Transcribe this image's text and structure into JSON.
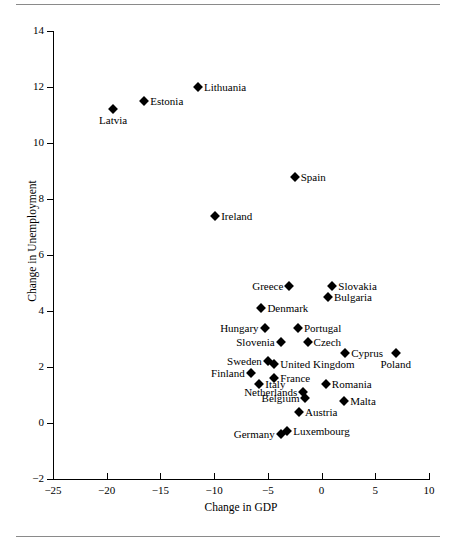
{
  "figure": {
    "rule_top": "horizontal-rule",
    "rule_bottom": "horizontal-rule"
  },
  "chart_data": {
    "type": "scatter",
    "title": "",
    "xlabel": "Change in GDP",
    "ylabel": "Change in Unemployment",
    "xlim": [
      -25,
      10
    ],
    "ylim": [
      -2,
      14
    ],
    "xticks": [
      -25,
      -20,
      -15,
      -10,
      -5,
      0,
      5,
      10
    ],
    "xtick_labels": [
      "−25",
      "−20",
      "−15",
      "−10",
      "−5",
      "0",
      "5",
      "10"
    ],
    "yticks": [
      -2,
      0,
      2,
      4,
      6,
      8,
      10,
      12,
      14
    ],
    "ytick_labels": [
      "−2",
      "0",
      "2",
      "4",
      "6",
      "8",
      "10",
      "12",
      "14"
    ],
    "grid": false,
    "legend": "none",
    "marker": "diamond",
    "marker_color": "#000000",
    "points": [
      {
        "label": "Latvia",
        "x": -19.4,
        "y": 11.2,
        "label_pos": "below"
      },
      {
        "label": "Estonia",
        "x": -16.5,
        "y": 11.5,
        "label_pos": "right"
      },
      {
        "label": "Lithuania",
        "x": -11.5,
        "y": 12.0,
        "label_pos": "right"
      },
      {
        "label": "Spain",
        "x": -2.5,
        "y": 8.8,
        "label_pos": "right"
      },
      {
        "label": "Ireland",
        "x": -9.9,
        "y": 7.4,
        "label_pos": "right"
      },
      {
        "label": "Greece",
        "x": -3.0,
        "y": 4.9,
        "label_pos": "left"
      },
      {
        "label": "Slovakia",
        "x": 1.0,
        "y": 4.9,
        "label_pos": "right"
      },
      {
        "label": "Bulgaria",
        "x": 0.6,
        "y": 4.5,
        "label_pos": "right"
      },
      {
        "label": "Denmark",
        "x": -5.6,
        "y": 4.1,
        "label_pos": "right"
      },
      {
        "label": "Hungary",
        "x": -5.3,
        "y": 3.4,
        "label_pos": "left"
      },
      {
        "label": "Portugal",
        "x": -2.2,
        "y": 3.4,
        "label_pos": "right"
      },
      {
        "label": "Slovenia",
        "x": -3.8,
        "y": 2.9,
        "label_pos": "left"
      },
      {
        "label": "Czech",
        "x": -1.3,
        "y": 2.9,
        "label_pos": "right"
      },
      {
        "label": "Cyprus",
        "x": 2.2,
        "y": 2.5,
        "label_pos": "right"
      },
      {
        "label": "Poland",
        "x": 6.9,
        "y": 2.5,
        "label_pos": "below"
      },
      {
        "label": "Sweden",
        "x": -5.0,
        "y": 2.2,
        "label_pos": "left"
      },
      {
        "label": "United Kingdom",
        "x": -4.4,
        "y": 2.1,
        "label_pos": "right"
      },
      {
        "label": "Finland",
        "x": -6.6,
        "y": 1.8,
        "label_pos": "left"
      },
      {
        "label": "France",
        "x": -4.4,
        "y": 1.6,
        "label_pos": "right"
      },
      {
        "label": "Italy",
        "x": -5.8,
        "y": 1.4,
        "label_pos": "right"
      },
      {
        "label": "Romania",
        "x": 0.4,
        "y": 1.4,
        "label_pos": "right"
      },
      {
        "label": "Netherlands",
        "x": -1.7,
        "y": 1.1,
        "label_pos": "left"
      },
      {
        "label": "Belgium",
        "x": -1.5,
        "y": 0.9,
        "label_pos": "left"
      },
      {
        "label": "Malta",
        "x": 2.1,
        "y": 0.8,
        "label_pos": "right"
      },
      {
        "label": "Austria",
        "x": -2.1,
        "y": 0.4,
        "label_pos": "right"
      },
      {
        "label": "Germany",
        "x": -3.8,
        "y": -0.4,
        "label_pos": "left"
      },
      {
        "label": "Luxembourg",
        "x": -3.2,
        "y": -0.3,
        "label_pos": "right"
      }
    ]
  }
}
